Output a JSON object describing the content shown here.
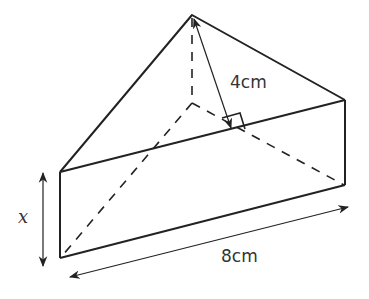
{
  "diagram": {
    "type": "triangular-prism",
    "labels": {
      "height": "4cm",
      "length": "8cm",
      "depth": "x"
    },
    "colors": {
      "stroke": "#222222",
      "text": "#333333",
      "background": "#ffffff"
    }
  }
}
